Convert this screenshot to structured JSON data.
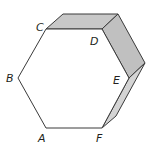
{
  "diagram": {
    "colors": {
      "stroke": "#3a3a3a",
      "shaded_face": "#c8c8c8",
      "background": "#ffffff"
    },
    "vertices": {
      "A": {
        "label": "A",
        "x": 46,
        "y": 128
      },
      "B": {
        "label": "B",
        "x": 18,
        "y": 78
      },
      "C": {
        "label": "C",
        "x": 46,
        "y": 29
      },
      "D": {
        "label": "D",
        "x": 102,
        "y": 29
      },
      "E": {
        "label": "E",
        "x": 129,
        "y": 78
      },
      "F": {
        "label": "F",
        "x": 102,
        "y": 128
      }
    },
    "labels": [
      {
        "text": "A",
        "x": 38,
        "y": 142
      },
      {
        "text": "B",
        "x": 6,
        "y": 82
      },
      {
        "text": "C",
        "x": 36,
        "y": 31
      },
      {
        "text": "D",
        "x": 90,
        "y": 45
      },
      {
        "text": "E",
        "x": 113,
        "y": 84
      },
      {
        "text": "F",
        "x": 96,
        "y": 142
      }
    ]
  }
}
